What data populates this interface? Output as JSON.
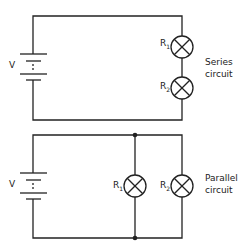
{
  "series": {
    "voltage_label": "V",
    "r1_label": "R",
    "r1_sub": "1",
    "r2_label": "R",
    "r2_sub": "2",
    "title_line1": "Series",
    "title_line2": "circuit"
  },
  "parallel": {
    "voltage_label": "V",
    "r1_label": "R",
    "r1_sub": "1",
    "r2_label": "R",
    "r2_sub": "2",
    "title_line1": "Parallel",
    "title_line2": "circuit"
  },
  "colors": {
    "wire": "#222222",
    "background": "#ffffff"
  }
}
